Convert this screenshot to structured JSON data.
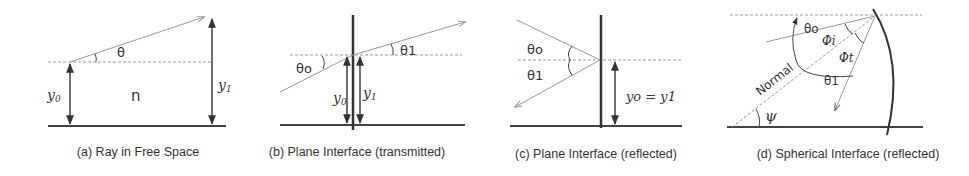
{
  "figure": {
    "panels": [
      {
        "id": "a",
        "caption": "(a) Ray in Free Space",
        "labels": {
          "theta": "θ",
          "n": "n",
          "y0": "y",
          "y0_sub": "0",
          "y1": "y",
          "y1_sub": "1"
        }
      },
      {
        "id": "b",
        "caption": "(b) Plane Interface (transmitted)",
        "labels": {
          "theta0": "θo",
          "theta1": "θ1",
          "y0": "y",
          "y0_sub": "0",
          "y1": "y",
          "y1_sub": "1"
        }
      },
      {
        "id": "c",
        "caption": "(c) Plane Interface (reflected)",
        "labels": {
          "theta0": "θo",
          "theta1": "θ1",
          "y_eq": "yo = y1"
        }
      },
      {
        "id": "d",
        "caption": "(d)  Spherical Interface (reflected)",
        "labels": {
          "theta0": "θo",
          "phi_i": "Φi",
          "phi_t": "Φt",
          "theta1": "θ1",
          "normal": "Normal",
          "psi": "ψ"
        }
      }
    ],
    "colors": {
      "line": "#333333",
      "ray": "#9a9a9a",
      "background": "#ffffff"
    }
  }
}
